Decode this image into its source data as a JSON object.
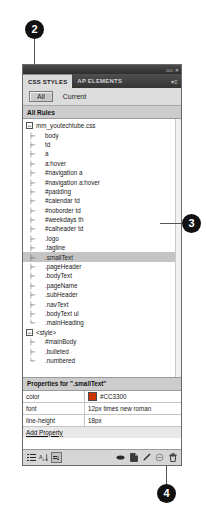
{
  "callouts": [
    {
      "id": "2",
      "label": "2"
    },
    {
      "id": "3",
      "label": "3"
    },
    {
      "id": "4",
      "label": "4"
    }
  ],
  "panel": {
    "titlebar": {
      "collapse_glyph": "▫▫",
      "close_glyph": "✕"
    },
    "tabs": [
      {
        "label": "CSS STYLES",
        "active": true
      },
      {
        "label": "AP ELEMENTS",
        "active": false
      }
    ],
    "tab_menu_glyph": "▾≡",
    "mode_buttons": [
      {
        "label": "All",
        "selected": true
      },
      {
        "label": "Current",
        "selected": false
      }
    ],
    "rules_header": "All Rules",
    "rules_tree": [
      {
        "label": "mm_youtechtube.css",
        "level": 0,
        "toggle": "−",
        "selected": false
      },
      {
        "label": "body",
        "level": 1,
        "elbow": "├─",
        "selected": false
      },
      {
        "label": "td",
        "level": 1,
        "elbow": "├─",
        "selected": false
      },
      {
        "label": "a",
        "level": 1,
        "elbow": "├─",
        "selected": false
      },
      {
        "label": "a:hover",
        "level": 1,
        "elbow": "├─",
        "selected": false
      },
      {
        "label": "#navigation a",
        "level": 1,
        "elbow": "├─",
        "selected": false
      },
      {
        "label": "#navigation a:hover",
        "level": 1,
        "elbow": "├─",
        "selected": false
      },
      {
        "label": "#padding",
        "level": 1,
        "elbow": "├─",
        "selected": false
      },
      {
        "label": "#calendar td",
        "level": 1,
        "elbow": "├─",
        "selected": false
      },
      {
        "label": "#noborder td",
        "level": 1,
        "elbow": "├─",
        "selected": false
      },
      {
        "label": "#weekdays th",
        "level": 1,
        "elbow": "├─",
        "selected": false
      },
      {
        "label": "#calheader td",
        "level": 1,
        "elbow": "├─",
        "selected": false
      },
      {
        "label": ".logo",
        "level": 1,
        "elbow": "├─",
        "selected": false
      },
      {
        "label": ".tagline",
        "level": 1,
        "elbow": "├─",
        "selected": false
      },
      {
        "label": ".smallText",
        "level": 1,
        "elbow": "├─",
        "selected": true
      },
      {
        "label": ".pageHeader",
        "level": 1,
        "elbow": "├─",
        "selected": false
      },
      {
        "label": ".bodyText",
        "level": 1,
        "elbow": "├─",
        "selected": false
      },
      {
        "label": ".pageName",
        "level": 1,
        "elbow": "├─",
        "selected": false
      },
      {
        "label": ".subHeader",
        "level": 1,
        "elbow": "├─",
        "selected": false
      },
      {
        "label": ".navText",
        "level": 1,
        "elbow": "├─",
        "selected": false
      },
      {
        "label": ".bodyText ul",
        "level": 1,
        "elbow": "├─",
        "selected": false
      },
      {
        "label": ".mainHeading",
        "level": 1,
        "elbow": "└─",
        "selected": false
      },
      {
        "label": "<style>",
        "level": 0,
        "toggle": "−",
        "selected": false
      },
      {
        "label": "#mainBody",
        "level": 1,
        "elbow": "├─",
        "selected": false
      },
      {
        "label": ".bulleted",
        "level": 1,
        "elbow": "├─",
        "selected": false
      },
      {
        "label": ".numbered",
        "level": 1,
        "elbow": "└─",
        "selected": false
      }
    ],
    "properties_header": "Properties for \".smallText\"",
    "properties": [
      {
        "name": "color",
        "value": "#CC3300",
        "swatch": "#CC3300"
      },
      {
        "name": "font",
        "value": "12px times new roman",
        "swatch": null
      },
      {
        "name": "line-height",
        "value": "18px",
        "swatch": null
      }
    ],
    "add_property_label": "Add Property",
    "toolbar_left": [
      {
        "icon": "category-view-icon",
        "boxed": false
      },
      {
        "icon": "alphabetical-view-icon",
        "boxed": false
      },
      {
        "icon": "set-properties-view-icon",
        "boxed": true
      }
    ],
    "toolbar_right": [
      {
        "icon": "attach-style-sheet-icon"
      },
      {
        "icon": "new-css-rule-icon"
      },
      {
        "icon": "edit-rule-icon"
      },
      {
        "icon": "disable-property-icon"
      },
      {
        "icon": "delete-rule-icon"
      }
    ]
  },
  "colors": {
    "accent": "#CC3300",
    "panel_bg": "#E8E8E8",
    "titlebar": "#2E2E2E",
    "selection": "#C4C4C4"
  }
}
